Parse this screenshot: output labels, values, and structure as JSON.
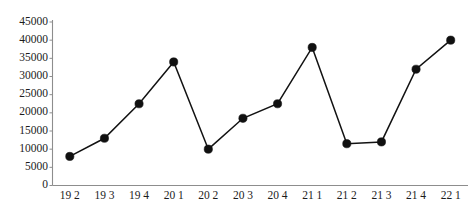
{
  "chart_data": {
    "type": "line",
    "title": "",
    "subtitle": "",
    "xlabel": "",
    "ylabel": "",
    "categories": [
      "19 2",
      "19 3",
      "19 4",
      "20 1",
      "20 2",
      "20 3",
      "20 4",
      "21 1",
      "21 2",
      "21 3",
      "21 4",
      "22 1"
    ],
    "values": [
      8000,
      13000,
      22500,
      34000,
      10000,
      18500,
      22500,
      38000,
      11500,
      12000,
      32000,
      40000
    ],
    "series": [
      {
        "name": "series-1",
        "values": [
          8000,
          13000,
          22500,
          34000,
          10000,
          18500,
          22500,
          38000,
          11500,
          12000,
          32000,
          40000
        ]
      }
    ],
    "ylim": [
      0,
      45000
    ],
    "ytick_values": [
      0,
      5000,
      10000,
      15000,
      20000,
      25000,
      30000,
      35000,
      40000,
      45000
    ],
    "ytick_labels": [
      "0",
      "5000",
      "10000",
      "15000",
      "20000",
      "25000",
      "30000",
      "35000",
      "40000",
      "45000"
    ],
    "xtick_labels": [
      "19 2",
      "19 3",
      "19 4",
      "20 1",
      "20 2",
      "20 3",
      "20 4",
      "21 1",
      "21 2",
      "21 3",
      "21 4",
      "22 1"
    ],
    "grid": false,
    "legend": false,
    "legend_position": "none",
    "marker": "circle",
    "marker_color": "#101010",
    "line_color": "#121212",
    "axis_color": "#8d8d8d",
    "background_color": "#ffffff",
    "annotations": []
  }
}
